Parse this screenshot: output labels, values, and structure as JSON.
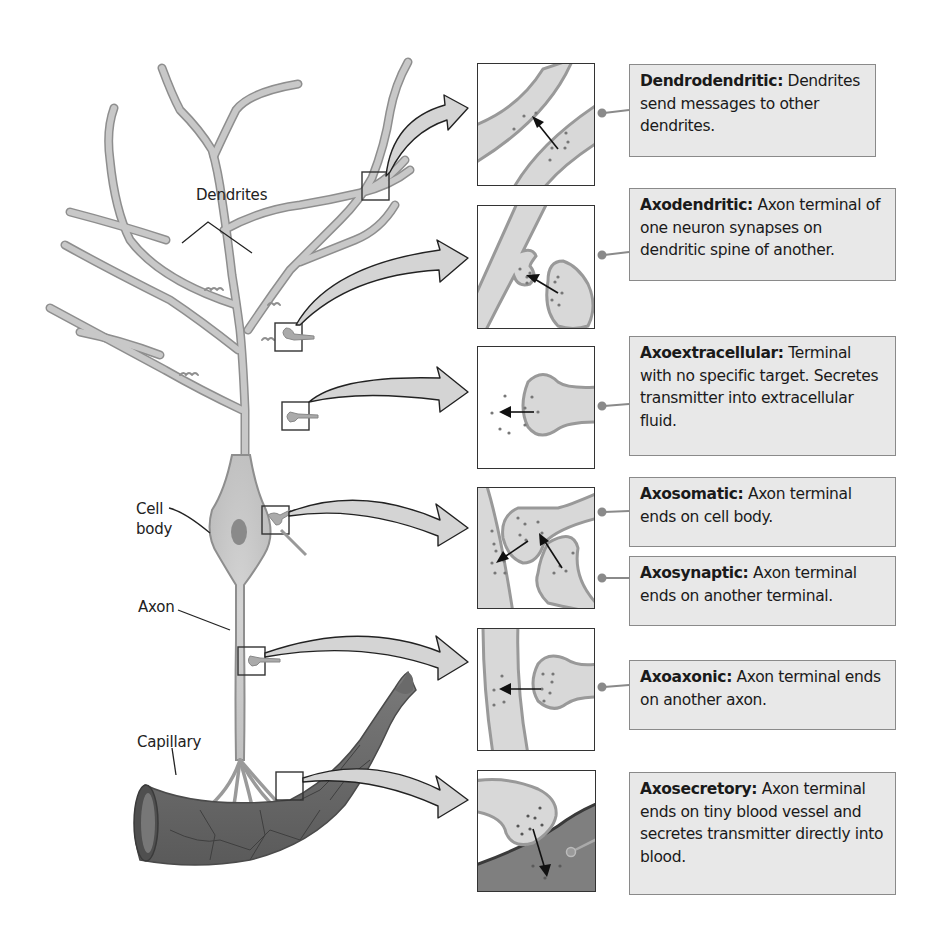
{
  "figure": {
    "labels": {
      "dendrites": "Dendrites",
      "cell_body_line1": "Cell",
      "cell_body_line2": "body",
      "axon": "Axon",
      "capillary": "Capillary"
    },
    "synapse_types": [
      {
        "id": "dendrodendritic",
        "term": "Dendrodendritic:",
        "description": "Dendrites send messages to other dendrites."
      },
      {
        "id": "axodendritic",
        "term": "Axodendritic:",
        "description": "Axon terminal of one neuron synapses on dendritic spine of another."
      },
      {
        "id": "axoextracellular",
        "term": "Axoextracellular:",
        "description": "Terminal with no specific target. Secretes transmitter into extracellular fluid."
      },
      {
        "id": "axosomatic",
        "term": "Axosomatic:",
        "description": "Axon terminal ends on cell body."
      },
      {
        "id": "axosynaptic",
        "term": "Axosynaptic:",
        "description": "Axon terminal ends on another terminal."
      },
      {
        "id": "axoaxonic",
        "term": "Axoaxonic:",
        "description": "Axon terminal ends on another axon."
      },
      {
        "id": "axosecretory",
        "term": "Axosecretory:",
        "description": "Axon terminal ends on tiny blood vessel and secretes transmitter directly into blood."
      }
    ],
    "colors": {
      "neuron_fill": "#c8c8c8",
      "neuron_outline": "#8e8e8e",
      "callout_fill": "#e8e8e8",
      "callout_border": "#8a8a8a",
      "capillary_fill": "#6f6f6f",
      "arrow_fill": "#d4d4d4"
    }
  }
}
